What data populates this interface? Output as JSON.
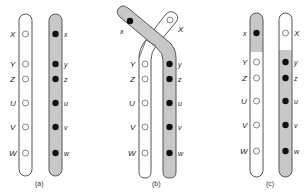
{
  "figure": {
    "colors": {
      "shaded": "#c8c8c8",
      "outline": "#555555",
      "dominant_marker": "#ffffff",
      "recessive_marker": "#111111"
    },
    "loci_upper": [
      "X",
      "Y",
      "Z",
      "U",
      "V",
      "W"
    ],
    "loci_lower": [
      "x",
      "y",
      "z",
      "u",
      "v",
      "w"
    ],
    "panels": [
      {
        "caption": "(a)",
        "description": "Homologous chromosome pair before crossing over",
        "left": {
          "labels": [
            "X",
            "Y",
            "Z",
            "U",
            "V",
            "W"
          ],
          "shaded": false
        },
        "right": {
          "labels": [
            "x",
            "y",
            "z",
            "u",
            "v",
            "w"
          ],
          "shaded": true
        }
      },
      {
        "caption": "(b)",
        "description": "Chromatids crossing over between X and Y",
        "left": {
          "labels": [
            "x",
            "Y",
            "Z",
            "U",
            "V",
            "W"
          ]
        },
        "right": {
          "labels": [
            "X",
            "y",
            "z",
            "u",
            "v",
            "w"
          ]
        }
      },
      {
        "caption": "(c)",
        "description": "Recombinant chromosomes after crossing over",
        "left": {
          "labels": [
            "x",
            "Y",
            "Z",
            "U",
            "V",
            "W"
          ]
        },
        "right": {
          "labels": [
            "X",
            "y",
            "z",
            "u",
            "v",
            "w"
          ]
        }
      }
    ]
  }
}
